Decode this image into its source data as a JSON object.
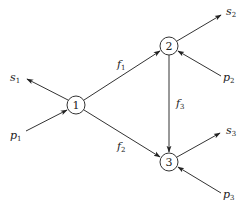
{
  "diagram": {
    "nodes": [
      {
        "id": "1",
        "label": "1",
        "x": 76,
        "y": 105
      },
      {
        "id": "2",
        "label": "2",
        "x": 169,
        "y": 46
      },
      {
        "id": "3",
        "label": "3",
        "x": 169,
        "y": 162
      }
    ],
    "edges": [
      {
        "from": "1",
        "to": "2",
        "label": "f",
        "sub": "1"
      },
      {
        "from": "1",
        "to": "3",
        "label": "f",
        "sub": "2"
      },
      {
        "from": "2",
        "to": "3",
        "label": "f",
        "sub": "3"
      }
    ],
    "external": {
      "s1": {
        "label": "s",
        "sub": "1"
      },
      "p1": {
        "label": "p",
        "sub": "1"
      },
      "s2": {
        "label": "s",
        "sub": "2"
      },
      "p2": {
        "label": "p",
        "sub": "2"
      },
      "s3": {
        "label": "s",
        "sub": "3"
      },
      "p3": {
        "label": "p",
        "sub": "3"
      }
    },
    "colors": {
      "stroke": "#333333",
      "text": "#222222"
    }
  }
}
